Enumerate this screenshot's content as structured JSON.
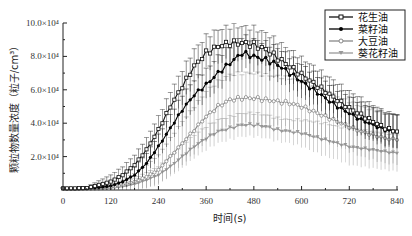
{
  "chart_data": {
    "type": "line",
    "title": "",
    "xlabel": "时间(s)",
    "ylabel": "颗粒物数量浓度（粒子/cm³）",
    "xlim": [
      0,
      840
    ],
    "ylim": [
      0,
      100000
    ],
    "x_ticks": [
      0,
      120,
      240,
      360,
      480,
      600,
      720,
      840
    ],
    "y_ticks": [
      20000,
      40000,
      60000,
      80000,
      100000
    ],
    "y_tick_labels": [
      "2.0×10⁴",
      "4.0×10⁴",
      "6.0×10⁴",
      "8.0×10⁴",
      "10.0×10⁴"
    ],
    "grid": false,
    "legend_position": "upper right",
    "error_bars": true,
    "x": [
      0,
      30,
      60,
      90,
      120,
      150,
      180,
      210,
      240,
      270,
      300,
      330,
      360,
      390,
      420,
      450,
      480,
      510,
      540,
      570,
      600,
      630,
      660,
      690,
      720,
      750,
      780,
      810,
      840
    ],
    "series": [
      {
        "name": "花生油",
        "color": "#111111",
        "marker": "open-square",
        "values": [
          1000,
          1000,
          1200,
          3000,
          5000,
          9000,
          15000,
          24000,
          36000,
          50000,
          62000,
          74000,
          82000,
          86000,
          88000,
          88000,
          87000,
          84000,
          79000,
          74000,
          69000,
          64000,
          59000,
          54000,
          49000,
          45000,
          41000,
          37000,
          35000
        ],
        "errors": [
          500,
          500,
          800,
          2500,
          4000,
          5000,
          6000,
          7000,
          8000,
          9000,
          10000,
          10000,
          10000,
          10000,
          10000,
          10000,
          10000,
          10000,
          10000,
          10000,
          10000,
          10000,
          10000,
          10000,
          10000,
          10000,
          10000,
          10000,
          10000
        ]
      },
      {
        "name": "菜籽油",
        "color": "#000000",
        "marker": "filled-circle",
        "values": [
          800,
          800,
          1000,
          1500,
          2500,
          5000,
          9000,
          16000,
          26000,
          37000,
          48000,
          57000,
          63000,
          70000,
          76000,
          82000,
          80000,
          78000,
          75000,
          70000,
          65000,
          60000,
          55000,
          50000,
          46000,
          42000,
          39000,
          36000,
          35000
        ],
        "errors": [
          400,
          400,
          600,
          1500,
          3000,
          4000,
          5000,
          6000,
          7000,
          8000,
          9000,
          9000,
          9000,
          10000,
          10000,
          10000,
          10000,
          10000,
          10000,
          10000,
          10000,
          10000,
          10000,
          10000,
          10000,
          10000,
          10000,
          10000,
          10000
        ]
      },
      {
        "name": "大豆油",
        "color": "#888888",
        "marker": "open-circle",
        "values": [
          700,
          700,
          800,
          1000,
          1500,
          3000,
          5000,
          8000,
          12000,
          20000,
          28000,
          36000,
          44000,
          50000,
          54000,
          55000,
          55000,
          54000,
          53000,
          52000,
          50000,
          47000,
          44000,
          41000,
          38000,
          35000,
          33000,
          31000,
          30000
        ],
        "errors": [
          300,
          300,
          500,
          1000,
          2000,
          3000,
          5000,
          7000,
          9000,
          11000,
          13000,
          14000,
          15000,
          15000,
          15000,
          15000,
          15000,
          15000,
          15000,
          15000,
          15000,
          15000,
          15000,
          15000,
          15000,
          15000,
          15000,
          15000,
          15000
        ]
      },
      {
        "name": "葵花籽油",
        "color": "#999999",
        "marker": "filled-triangle",
        "values": [
          600,
          600,
          700,
          900,
          1200,
          2000,
          3500,
          6000,
          9000,
          14000,
          20000,
          26000,
          31000,
          35000,
          37000,
          39000,
          39000,
          38000,
          36000,
          35000,
          34000,
          32000,
          30000,
          28000,
          26000,
          25000,
          24000,
          23000,
          22000
        ],
        "errors": [
          300,
          300,
          400,
          800,
          1500,
          2500,
          3500,
          4500,
          5000,
          6000,
          7000,
          7000,
          7000,
          7000,
          7000,
          7000,
          7000,
          7000,
          7000,
          7000,
          8000,
          9000,
          10000,
          10000,
          11000,
          11000,
          11000,
          11000,
          11000
        ]
      }
    ]
  },
  "legend": {
    "items": [
      "花生油",
      "菜籽油",
      "大豆油",
      "葵花籽油"
    ]
  },
  "axes": {
    "xlabel": "时间(s)",
    "ylabel": "颗粒物数量浓度（粒子/cm³）"
  }
}
